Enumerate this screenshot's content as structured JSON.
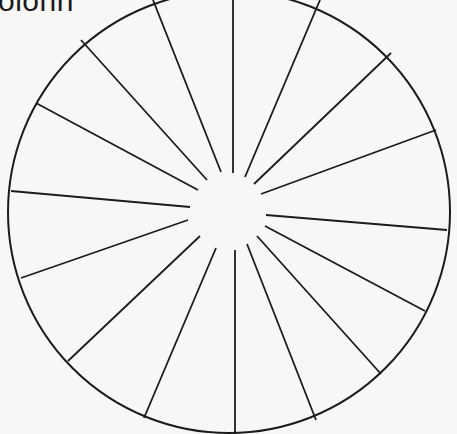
{
  "caption": {
    "text": "olonn"
  },
  "diagram": {
    "type": "spoked-circle",
    "spoke_count": 16,
    "colors": {
      "stroke": "#1c1c1c",
      "background": "#f7f7f5"
    },
    "rim": {
      "cx": 229,
      "cy": 212,
      "r": 221
    },
    "spokes": [
      {
        "id": "spoke-top",
        "x1": 233,
        "y1": 0,
        "x2": 233,
        "y2": 173
      },
      {
        "id": "spoke-top-right-1",
        "x1": 320,
        "y1": 0,
        "x2": 245,
        "y2": 177
      },
      {
        "id": "spoke-top-right-2",
        "x1": 391,
        "y1": 53,
        "x2": 254,
        "y2": 184
      },
      {
        "id": "spoke-top-right-3",
        "x1": 436,
        "y1": 130,
        "x2": 261,
        "y2": 194
      },
      {
        "id": "spoke-right",
        "x1": 447,
        "y1": 230,
        "x2": 266,
        "y2": 215
      },
      {
        "id": "spoke-bottom-right-1",
        "x1": 425,
        "y1": 311,
        "x2": 265,
        "y2": 226
      },
      {
        "id": "spoke-bottom-right-2",
        "x1": 381,
        "y1": 374,
        "x2": 257,
        "y2": 236
      },
      {
        "id": "spoke-bottom-right-3",
        "x1": 316,
        "y1": 420,
        "x2": 247,
        "y2": 244
      },
      {
        "id": "spoke-bottom",
        "x1": 235,
        "y1": 434,
        "x2": 235,
        "y2": 250
      },
      {
        "id": "spoke-bottom-left-1",
        "x1": 144,
        "y1": 418,
        "x2": 216,
        "y2": 248
      },
      {
        "id": "spoke-bottom-left-2",
        "x1": 68,
        "y1": 361,
        "x2": 200,
        "y2": 236
      },
      {
        "id": "spoke-bottom-left-3",
        "x1": 21,
        "y1": 278,
        "x2": 188,
        "y2": 220
      },
      {
        "id": "spoke-left",
        "x1": 11,
        "y1": 191,
        "x2": 190,
        "y2": 207
      },
      {
        "id": "spoke-top-left-1",
        "x1": 36,
        "y1": 103,
        "x2": 198,
        "y2": 190
      },
      {
        "id": "spoke-top-left-2",
        "x1": 81,
        "y1": 40,
        "x2": 207,
        "y2": 180
      },
      {
        "id": "spoke-top-left-3",
        "x1": 153,
        "y1": 0,
        "x2": 221,
        "y2": 172
      }
    ]
  }
}
